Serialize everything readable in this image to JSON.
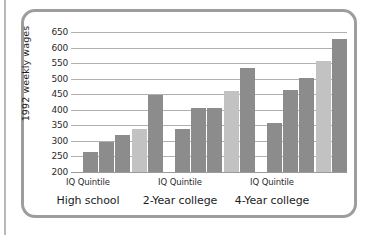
{
  "figure": {
    "frame_color": "#9d9d9d",
    "background": "#ffffff"
  },
  "chart_data": {
    "type": "bar",
    "title": "",
    "subtitle": "",
    "xlabel": "",
    "ylabel": "1992 weekly wages",
    "ylim": [
      200,
      650
    ],
    "ytick_step": 50,
    "yticks": [
      650,
      600,
      550,
      500,
      450,
      400,
      350,
      300,
      250,
      200
    ],
    "grid": true,
    "legend": null,
    "legend_position": "none",
    "categories": [
      "High school",
      "2-Year college",
      "4-Year college"
    ],
    "group_axis_label": "IQ Quintile",
    "series": [
      {
        "name": "Quintile 1",
        "values": [
          265,
          337,
          356
        ],
        "color": "#8c8c8c"
      },
      {
        "name": "Quintile 2",
        "values": [
          295,
          407,
          464
        ],
        "color": "#8c8c8c"
      },
      {
        "name": "Quintile 3",
        "values": [
          320,
          407,
          502
        ],
        "color": "#8c8c8c"
      },
      {
        "name": "Quintile 4",
        "values": [
          338,
          459,
          558
        ],
        "color": "#c2c2c2"
      },
      {
        "name": "Quintile 5",
        "values": [
          448,
          533,
          628
        ],
        "color": "#8c8c8c"
      }
    ]
  },
  "axis": {
    "y_title": "1992 weekly wages",
    "tick_650": "650",
    "tick_600": "600",
    "tick_550": "550",
    "tick_500": "500",
    "tick_450": "450",
    "tick_400": "400",
    "tick_350": "350",
    "tick_300": "300",
    "tick_250": "250",
    "tick_200": "200"
  },
  "x_axis": {
    "groups": [
      {
        "tick": "IQ Quintile",
        "name": "High school"
      },
      {
        "tick": "IQ Quintile",
        "name": "2-Year college"
      },
      {
        "tick": "IQ Quintile",
        "name": "4-Year college"
      }
    ]
  }
}
